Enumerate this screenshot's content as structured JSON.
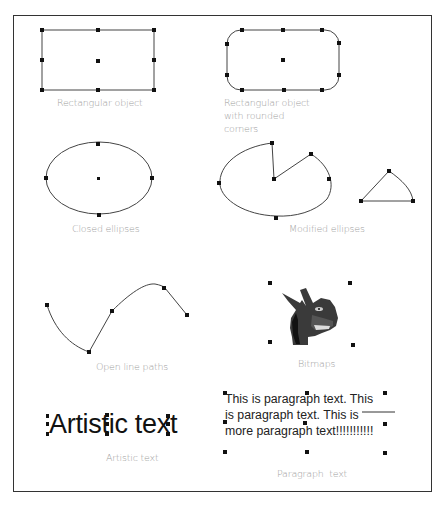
{
  "figure": {
    "objects": [
      {
        "id": "rectangle",
        "caption": "Rectangular object"
      },
      {
        "id": "rounded-rectangle",
        "caption_lines": [
          "Rectangular object",
          "with rounded",
          "corners"
        ]
      },
      {
        "id": "closed-ellipse",
        "caption": "Closed ellipses"
      },
      {
        "id": "modified-ellipses",
        "caption": "Modified ellipses"
      },
      {
        "id": "open-line-path",
        "caption": "Open line paths"
      },
      {
        "id": "bitmap",
        "caption": "Bitmaps"
      },
      {
        "id": "artistic-text",
        "caption": "Artistic text",
        "sample_text": "Artistic text"
      },
      {
        "id": "paragraph-text",
        "caption": "Paragraph  text",
        "sample_lines": [
          "This is paragraph text. This",
          "is paragraph text. This is",
          "more paragraph text!!!!!!!!!!!"
        ]
      }
    ]
  },
  "colors": {
    "outline": "#333333",
    "handle": "#111111",
    "caption": "#a0a0a0"
  }
}
